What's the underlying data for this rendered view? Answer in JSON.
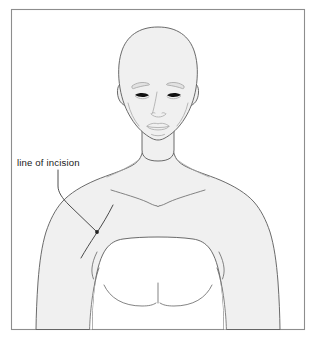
{
  "figure": {
    "kind": "anatomical-illustration",
    "view": "anterior",
    "background_color": "#ffffff",
    "frame": {
      "stroke_color": "#8d8d8d",
      "fill_color": "#ffffff",
      "x": 11,
      "y": 9,
      "width": 294,
      "height": 321
    },
    "body": {
      "fill_color": "#f0f0f0",
      "outline_color": "#5a5a5a",
      "detail_color": "#6e6e6e"
    },
    "annotations": [
      {
        "id": "incision-label",
        "label": "line of incision",
        "text_color": "#1a1a1a",
        "font_size_px": 9.6,
        "text_x": 17,
        "text_baseline_y": 166,
        "leader_from_x": 58,
        "leader_from_y": 170,
        "leader_to_x": 97,
        "leader_to_y": 232,
        "marker_x": 97,
        "marker_y": 232,
        "marker_color": "#222222"
      }
    ],
    "markings": [
      {
        "id": "incision-line",
        "name": "line of incision",
        "stroke_color": "#4a4a4a",
        "description": "oblique line across left deltoid / anterior shoulder"
      }
    ],
    "features": [
      "bald-head",
      "eyebrows",
      "eyes",
      "nose",
      "lips",
      "ears",
      "neck",
      "clavicles",
      "pectorals",
      "sternum",
      "shoulders",
      "upper-arms"
    ]
  }
}
